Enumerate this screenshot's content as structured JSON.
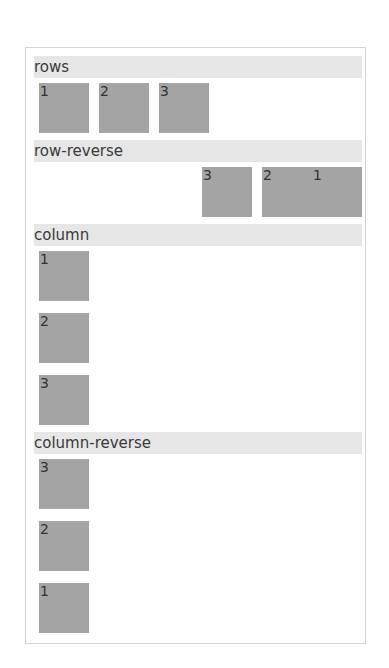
{
  "sections": [
    {
      "label": "rows",
      "direction": "row",
      "items": [
        "1",
        "2",
        "3"
      ]
    },
    {
      "label": "row-reverse",
      "direction": "row-reverse",
      "items": [
        "1",
        "2",
        "3"
      ]
    },
    {
      "label": "column",
      "direction": "column",
      "items": [
        "1",
        "2",
        "3"
      ]
    },
    {
      "label": "column-reverse",
      "direction": "column-reverse",
      "items": [
        "1",
        "2",
        "3"
      ]
    }
  ]
}
